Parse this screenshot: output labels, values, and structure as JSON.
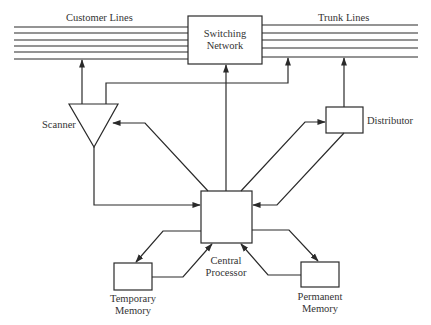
{
  "diagram": {
    "type": "block-diagram",
    "labels": {
      "customer_lines": "Customer Lines",
      "trunk_lines": "Trunk Lines",
      "switching_network_1": "Switching",
      "switching_network_2": "Network",
      "scanner": "Scanner",
      "distributor": "Distributor",
      "central_processor_1": "Central",
      "central_processor_2": "Processor",
      "temporary_memory_1": "Temporary",
      "temporary_memory_2": "Memory",
      "permanent_memory_1": "Permanent",
      "permanent_memory_2": "Memory"
    },
    "nodes": [
      {
        "id": "switching_network",
        "label": "Switching Network",
        "shape": "rectangle"
      },
      {
        "id": "scanner",
        "label": "Scanner",
        "shape": "triangle"
      },
      {
        "id": "distributor",
        "label": "Distributor",
        "shape": "rectangle"
      },
      {
        "id": "central_processor",
        "label": "Central Processor",
        "shape": "rectangle"
      },
      {
        "id": "temporary_memory",
        "label": "Temporary Memory",
        "shape": "rectangle"
      },
      {
        "id": "permanent_memory",
        "label": "Permanent Memory",
        "shape": "rectangle"
      }
    ],
    "line_groups": [
      {
        "id": "customer_lines",
        "label": "Customer Lines",
        "count": 6
      },
      {
        "id": "trunk_lines",
        "label": "Trunk Lines",
        "count": 5
      }
    ],
    "edges": [
      {
        "from": "scanner",
        "to": "customer_lines"
      },
      {
        "from": "scanner",
        "to": "trunk_lines"
      },
      {
        "from": "central_processor",
        "to": "switching_network"
      },
      {
        "from": "distributor",
        "to": "trunk_lines"
      },
      {
        "from": "central_processor",
        "to": "scanner"
      },
      {
        "from": "scanner",
        "to": "central_processor"
      },
      {
        "from": "central_processor",
        "to": "distributor"
      },
      {
        "from": "distributor",
        "to": "central_processor"
      },
      {
        "from": "central_processor",
        "to": "temporary_memory"
      },
      {
        "from": "temporary_memory",
        "to": "central_processor"
      },
      {
        "from": "central_processor",
        "to": "permanent_memory"
      },
      {
        "from": "permanent_memory",
        "to": "central_processor"
      }
    ]
  }
}
